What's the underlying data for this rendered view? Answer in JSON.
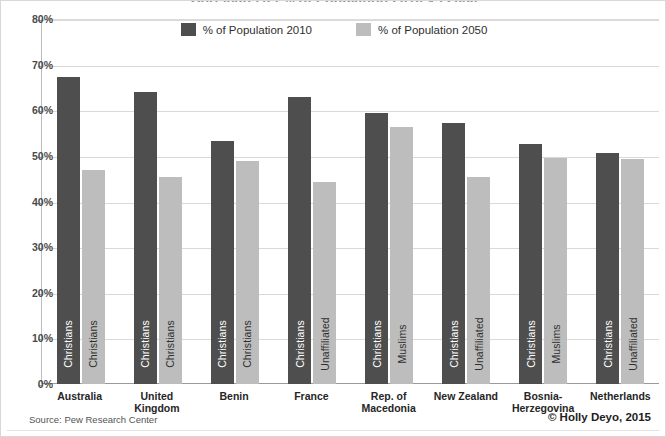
{
  "chart_data": {
    "type": "bar",
    "title": "Christians as % of Population 2010 vs 2050",
    "xlabel": "",
    "ylabel": "",
    "ylim": [
      0,
      80
    ],
    "ytick_labels": [
      "80%",
      "70%",
      "60%",
      "50%",
      "40%",
      "30%",
      "20%",
      "10%",
      "0%"
    ],
    "ytick_values": [
      80,
      70,
      60,
      50,
      40,
      30,
      20,
      10,
      0
    ],
    "grid": true,
    "legend_position": "top-center",
    "categories": [
      "Australia",
      "United Kingdom",
      "Benin",
      "France",
      "Rep. of Macedonia",
      "New Zealand",
      "Bosnia-Herzegovina",
      "Netherlands"
    ],
    "category_lines": [
      [
        "Australia"
      ],
      [
        "United Kingdom"
      ],
      [
        "Benin"
      ],
      [
        "France"
      ],
      [
        "Rep. of Macedonia"
      ],
      [
        "New Zealand"
      ],
      [
        "Bosnia-",
        "Herzegovina"
      ],
      [
        "Netherlands"
      ]
    ],
    "series": [
      {
        "name": "% of Population 2010",
        "color": "#4e4e4e",
        "values": [
          67.3,
          64.1,
          53.3,
          63.0,
          59.5,
          57.1,
          52.7,
          50.6
        ],
        "bar_labels": [
          "Christians",
          "Christians",
          "Christians",
          "Christians",
          "Christians",
          "Christians",
          "Christians",
          "Christians"
        ]
      },
      {
        "name": "% of Population 2050",
        "color": "#bdbdbd",
        "values": [
          47.0,
          45.4,
          48.8,
          44.2,
          56.4,
          45.3,
          49.6,
          49.4
        ],
        "bar_labels": [
          "Christians",
          "Christians",
          "Christians",
          "Unaffiliated",
          "Muslims",
          "Unaffiliated",
          "Muslims",
          "Unaffiliated"
        ]
      }
    ]
  },
  "legend": {
    "items": [
      {
        "label": "% of Population 2010",
        "color": "#4e4e4e"
      },
      {
        "label": "% of Population 2050",
        "color": "#bdbdbd"
      }
    ]
  },
  "footer": {
    "source": "Source: Pew Research Center",
    "credit": "© Holly Deyo, 2015"
  }
}
